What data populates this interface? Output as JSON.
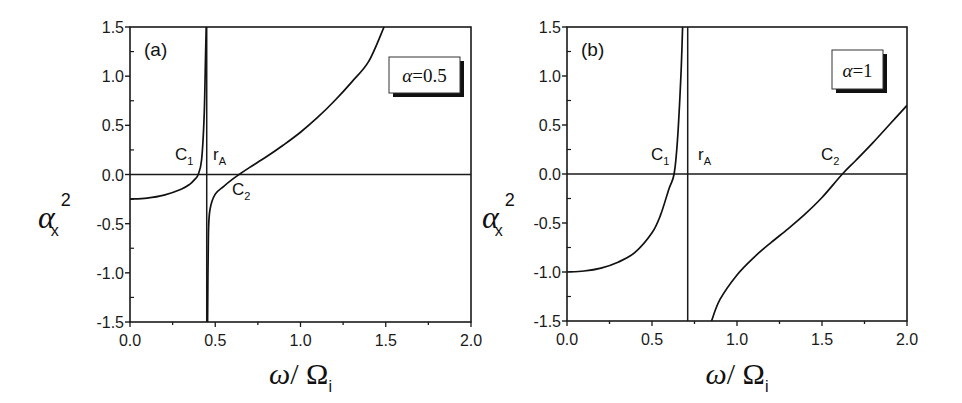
{
  "figure": {
    "panels": [
      {
        "id": "a",
        "tag": "(a)",
        "legend": "α=0.5",
        "annotations": {
          "c1": "C",
          "c1_sub": "1",
          "c2": "C",
          "c2_sub": "2",
          "ra": "r",
          "ra_sub": "A"
        }
      },
      {
        "id": "b",
        "tag": "(b)",
        "legend": "α=1",
        "annotations": {
          "c1": "C",
          "c1_sub": "1",
          "c2": "C",
          "c2_sub": "2",
          "ra": "r",
          "ra_sub": "A"
        }
      }
    ],
    "xlabel": {
      "main": "ω/ Ω",
      "sub": "i"
    },
    "ylabel": {
      "main": "α",
      "sub": "x",
      "sup": "2"
    },
    "x_ticks": [
      "0.0",
      "0.5",
      "1.0",
      "1.5",
      "2.0"
    ],
    "y_ticks": [
      "1.5",
      "1.0",
      "0.5",
      "0.0",
      "-0.5",
      "-1.0",
      "-1.5"
    ]
  },
  "chart_data": [
    {
      "type": "line",
      "title": "(a) α=0.5",
      "xlabel": "ω/Ω_i",
      "ylabel": "α_x^2",
      "xlim": [
        0,
        2.0
      ],
      "ylim": [
        -1.5,
        1.5
      ],
      "grid": false,
      "legend": "α=0.5 (upper right box)",
      "reference_lines": {
        "horizontal_y": 0.0,
        "vertical_x_rA": 0.45
      },
      "annotations": [
        {
          "text": "C1",
          "x": 0.4,
          "y": 0.0,
          "meaning": "cutoff 1"
        },
        {
          "text": "rA",
          "x": 0.45,
          "y": 0.0,
          "meaning": "Alfvén resonance"
        },
        {
          "text": "C2",
          "x": 0.64,
          "y": 0.0,
          "meaning": "cutoff 2"
        }
      ],
      "series": [
        {
          "name": "branch 1 (below resonance)",
          "x": [
            0.0,
            0.1,
            0.2,
            0.3,
            0.35,
            0.38,
            0.4,
            0.42,
            0.435,
            0.443,
            0.447
          ],
          "y": [
            -0.25,
            -0.24,
            -0.21,
            -0.15,
            -0.1,
            -0.05,
            0.0,
            0.15,
            0.6,
            1.2,
            1.5
          ]
        },
        {
          "name": "branch 2 (above resonance)",
          "x": [
            0.455,
            0.46,
            0.47,
            0.5,
            0.55,
            0.6,
            0.64,
            0.7,
            0.8,
            0.9,
            1.0,
            1.1,
            1.2,
            1.3,
            1.4,
            1.49
          ],
          "y": [
            -1.5,
            -0.6,
            -0.35,
            -0.2,
            -0.12,
            -0.05,
            0.0,
            0.07,
            0.18,
            0.3,
            0.43,
            0.58,
            0.75,
            0.94,
            1.15,
            1.5
          ]
        }
      ]
    },
    {
      "type": "line",
      "title": "(b) α=1",
      "xlabel": "ω/Ω_i",
      "ylabel": "α_x^2",
      "xlim": [
        0,
        2.0
      ],
      "ylim": [
        -1.5,
        1.5
      ],
      "grid": false,
      "legend": "α=1 (upper right box)",
      "reference_lines": {
        "horizontal_y": 0.0,
        "vertical_x_rA": 0.71
      },
      "annotations": [
        {
          "text": "C1",
          "x": 0.63,
          "y": 0.0,
          "meaning": "cutoff 1"
        },
        {
          "text": "rA",
          "x": 0.71,
          "y": 0.0,
          "meaning": "Alfvén resonance"
        },
        {
          "text": "C2",
          "x": 1.62,
          "y": 0.0,
          "meaning": "cutoff 2"
        }
      ],
      "series": [
        {
          "name": "branch 1 (below resonance)",
          "x": [
            0.0,
            0.1,
            0.2,
            0.3,
            0.4,
            0.5,
            0.55,
            0.6,
            0.63,
            0.65,
            0.67,
            0.68
          ],
          "y": [
            -1.0,
            -0.99,
            -0.96,
            -0.9,
            -0.8,
            -0.6,
            -0.42,
            -0.15,
            0.0,
            0.35,
            1.0,
            1.5
          ]
        },
        {
          "name": "branch 2 (above resonance)",
          "x": [
            0.85,
            0.9,
            1.0,
            1.1,
            1.2,
            1.3,
            1.4,
            1.5,
            1.62,
            1.7,
            1.8,
            1.9,
            2.0
          ],
          "y": [
            -1.5,
            -1.28,
            -1.03,
            -0.85,
            -0.7,
            -0.56,
            -0.41,
            -0.24,
            0.0,
            0.14,
            0.32,
            0.51,
            0.7
          ]
        }
      ]
    }
  ]
}
